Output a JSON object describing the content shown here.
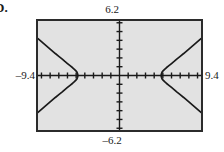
{
  "label": {
    "text": "D."
  },
  "window": {
    "xmin_label": "–9.4",
    "xmax_label": "9.4",
    "ymin_label": "–6.2",
    "ymax_label": "6.2",
    "frame_color": "#2b2b2b",
    "background_color": "#e2e2e2",
    "curve_color": "#1a1a1a",
    "axis_color": "#1a1a1a"
  },
  "chart_data": {
    "type": "line",
    "title": "",
    "subtitle": "",
    "xlabel": "",
    "ylabel": "",
    "xlim": [
      -9.4,
      9.4
    ],
    "ylim": [
      -6.2,
      6.2
    ],
    "xtick_step": 1,
    "ytick_step": 1,
    "grid": false,
    "legend": null,
    "axes": {
      "x_axis_y": 0,
      "y_axis_x": 0,
      "tick_marks": true,
      "tick_labels": false
    },
    "annotations": [
      {
        "text": "6.2",
        "position": "above-top-frame"
      },
      {
        "text": "–6.2",
        "position": "below-bottom-frame"
      },
      {
        "text": "–9.4",
        "position": "left-of-frame"
      },
      {
        "text": "9.4",
        "position": "right-of-frame"
      }
    ],
    "curve_description": "horizontal hyperbola, two branches opening left and right",
    "vertices": [
      [
        -4.8,
        0
      ],
      [
        4.8,
        0
      ]
    ],
    "series": [
      {
        "name": "left-branch",
        "points": [
          [
            -9.4,
            4.2
          ],
          [
            -9.0,
            3.86
          ],
          [
            -8.6,
            3.52
          ],
          [
            -8.2,
            3.18
          ],
          [
            -7.8,
            2.84
          ],
          [
            -7.4,
            2.5
          ],
          [
            -7.0,
            2.18
          ],
          [
            -6.6,
            1.86
          ],
          [
            -6.3,
            1.6
          ],
          [
            -6.0,
            1.36
          ],
          [
            -5.7,
            1.12
          ],
          [
            -5.4,
            0.88
          ],
          [
            -5.2,
            0.7
          ],
          [
            -5.0,
            0.5
          ],
          [
            -4.9,
            0.36
          ],
          [
            -4.84,
            0.2
          ],
          [
            -4.8,
            0.0
          ],
          [
            -4.84,
            -0.2
          ],
          [
            -4.9,
            -0.36
          ],
          [
            -5.0,
            -0.5
          ],
          [
            -5.2,
            -0.7
          ],
          [
            -5.4,
            -0.88
          ],
          [
            -5.7,
            -1.12
          ],
          [
            -6.0,
            -1.36
          ],
          [
            -6.3,
            -1.6
          ],
          [
            -6.6,
            -1.86
          ],
          [
            -7.0,
            -2.18
          ],
          [
            -7.4,
            -2.5
          ],
          [
            -7.8,
            -2.84
          ],
          [
            -8.2,
            -3.18
          ],
          [
            -8.6,
            -3.52
          ],
          [
            -9.0,
            -3.86
          ],
          [
            -9.4,
            -4.2
          ]
        ]
      },
      {
        "name": "right-branch",
        "points": [
          [
            9.4,
            4.2
          ],
          [
            9.0,
            3.86
          ],
          [
            8.6,
            3.52
          ],
          [
            8.2,
            3.18
          ],
          [
            7.8,
            2.84
          ],
          [
            7.4,
            2.5
          ],
          [
            7.0,
            2.18
          ],
          [
            6.6,
            1.86
          ],
          [
            6.3,
            1.6
          ],
          [
            6.0,
            1.36
          ],
          [
            5.7,
            1.12
          ],
          [
            5.4,
            0.88
          ],
          [
            5.2,
            0.7
          ],
          [
            5.0,
            0.5
          ],
          [
            4.9,
            0.36
          ],
          [
            4.84,
            0.2
          ],
          [
            4.8,
            0.0
          ],
          [
            4.84,
            -0.2
          ],
          [
            4.9,
            -0.36
          ],
          [
            5.0,
            -0.5
          ],
          [
            5.2,
            -0.7
          ],
          [
            5.4,
            -0.88
          ],
          [
            5.7,
            -1.12
          ],
          [
            6.0,
            -1.36
          ],
          [
            6.3,
            -1.6
          ],
          [
            6.6,
            -1.86
          ],
          [
            7.0,
            -2.18
          ],
          [
            7.4,
            -2.5
          ],
          [
            7.8,
            -2.84
          ],
          [
            8.2,
            -3.18
          ],
          [
            8.6,
            -3.52
          ],
          [
            9.0,
            -3.86
          ],
          [
            9.4,
            -4.2
          ]
        ]
      }
    ]
  }
}
